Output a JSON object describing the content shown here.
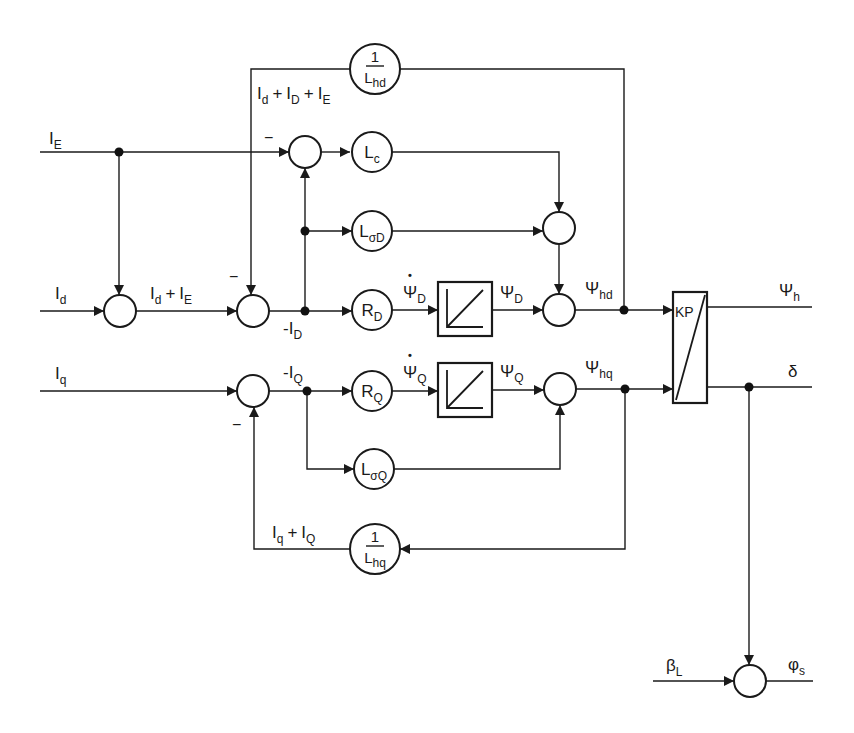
{
  "diagram": {
    "minus_sign": "−",
    "plus_sign": "+",
    "derivative_mark": "•",
    "inputs": {
      "IE": {
        "main": "I",
        "sub": "E"
      },
      "Id": {
        "main": "I",
        "sub": "d"
      },
      "Iq": {
        "main": "I",
        "sub": "q"
      },
      "betaL": {
        "main": "β",
        "sub": "L"
      }
    },
    "outputs": {
      "psi_h": {
        "main": "Ψ",
        "sub": "h"
      },
      "delta": {
        "main": "δ"
      },
      "phi_s": {
        "main": "φ",
        "sub": "s"
      }
    },
    "signals": {
      "sum_d_D_E": {
        "t1": "I",
        "s1": "d",
        "t2": "I",
        "s2": "D",
        "t3": "I",
        "s3": "E"
      },
      "sum_d_E": {
        "t1": "I",
        "s1": "d",
        "t2": "I",
        "s2": "E"
      },
      "sum_q_Q": {
        "t1": "I",
        "s1": "q",
        "t2": "I",
        "s2": "Q"
      },
      "neg_ID": {
        "main": "-I",
        "sub": "D"
      },
      "neg_IQ": {
        "main": "-I",
        "sub": "Q"
      },
      "psi_dot_D": {
        "main": "Ψ",
        "sub": "D"
      },
      "psi_D": {
        "main": "Ψ",
        "sub": "D"
      },
      "psi_hd": {
        "main": "Ψ",
        "sub": "hd"
      },
      "psi_dot_Q": {
        "main": "Ψ",
        "sub": "Q"
      },
      "psi_Q": {
        "main": "Ψ",
        "sub": "Q"
      },
      "psi_hq": {
        "main": "Ψ",
        "sub": "hq"
      }
    },
    "blocks": {
      "inv_Lhd": {
        "num": "1",
        "main": "L",
        "sub": "hd"
      },
      "Lc": {
        "main": "L",
        "sub": "c"
      },
      "LsigmaD": {
        "main": "L",
        "sub": "σD"
      },
      "RD": {
        "main": "R",
        "sub": "D"
      },
      "RQ": {
        "main": "R",
        "sub": "Q"
      },
      "LsigmaQ": {
        "main": "L",
        "sub": "σQ"
      },
      "inv_Lhq": {
        "num": "1",
        "main": "L",
        "sub": "hq"
      },
      "KP": {
        "label": "KP"
      },
      "integrator_D": {
        "type": "integrator"
      },
      "integrator_Q": {
        "type": "integrator"
      }
    },
    "colors": {
      "line": "#1a1a1a",
      "background": "#ffffff"
    }
  }
}
